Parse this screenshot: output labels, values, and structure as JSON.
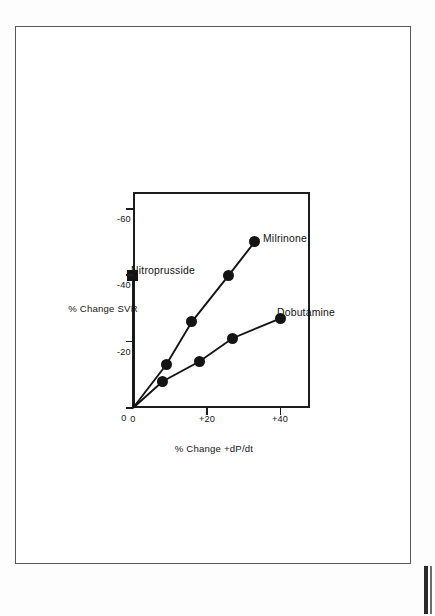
{
  "page": {
    "background_color": "#ffffff",
    "frame_color": "#58585a",
    "ink_color": "#141414"
  },
  "chart_data": {
    "type": "line",
    "title": "",
    "subtitle": "",
    "xlabel": "% Change SVR",
    "ylabel": "% Change +dP/dt",
    "xlim": [
      0,
      -65
    ],
    "ylim": [
      0,
      48
    ],
    "xticks": [
      0,
      -20,
      -40,
      -60
    ],
    "xticklabels": [
      "0",
      "-20",
      "-40",
      "-60"
    ],
    "yticks": [
      0,
      20,
      40
    ],
    "yticklabels": [
      "0",
      "+20",
      "+40"
    ],
    "grid": false,
    "legend": "inline-annotations",
    "series": [
      {
        "name": "Dobutamine",
        "marker": "filled-circle",
        "color": "#141414",
        "points": [
          {
            "x": 0,
            "y": 0
          },
          {
            "x": -8,
            "y": 8
          },
          {
            "x": -14,
            "y": 18
          },
          {
            "x": -21,
            "y": 27
          },
          {
            "x": -27,
            "y": 40
          }
        ]
      },
      {
        "name": "Milrinone",
        "marker": "filled-circle",
        "color": "#141414",
        "points": [
          {
            "x": 0,
            "y": 0
          },
          {
            "x": -13,
            "y": 9
          },
          {
            "x": -26,
            "y": 16
          },
          {
            "x": -40,
            "y": 26
          },
          {
            "x": -50,
            "y": 33
          }
        ]
      },
      {
        "name": "Nitroprusside",
        "marker": "filled-square",
        "color": "#141414",
        "points": [
          {
            "x": 0,
            "y": 0
          },
          {
            "x": -40,
            "y": 0
          }
        ]
      }
    ],
    "annotations": [
      {
        "text": "Dobutamine",
        "for": "Dobutamine"
      },
      {
        "text": "Milrinone",
        "for": "Milrinone"
      },
      {
        "text": "Nitroprusside",
        "for": "Nitroprusside"
      }
    ]
  }
}
